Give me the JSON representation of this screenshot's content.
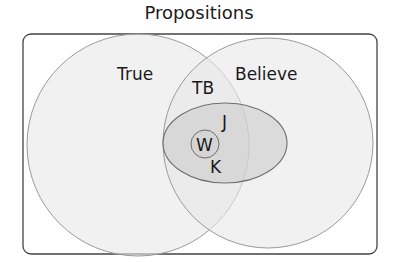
{
  "title": "Propositions",
  "regions": {
    "true": {
      "label": "True"
    },
    "believe": {
      "label": "Believe"
    },
    "true_and_believe": {
      "label": "TB"
    },
    "justified": {
      "label": "J"
    },
    "knowledge": {
      "label": "K"
    },
    "w": {
      "label": "W"
    }
  },
  "colors": {
    "background": "#ffffff",
    "frame_stroke": "#444444",
    "circle_fill": "#efefef",
    "circle_stroke": "#9a9a9a",
    "ellipse_fill": "#cfcfcf",
    "ellipse_stroke": "#6e6e6e",
    "text": "#1a1a1a"
  }
}
